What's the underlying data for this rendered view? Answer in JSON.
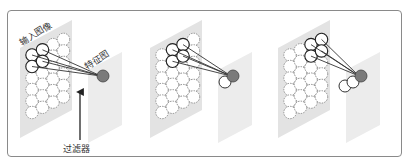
{
  "diagram": {
    "title": "",
    "labels": {
      "input_image": "输入图像",
      "feature_map": "特征图",
      "filter": "过滤器"
    },
    "panels": [
      {
        "step": 1,
        "output_circles_white": 0,
        "filter_position": "top-left"
      },
      {
        "step": 2,
        "output_circles_white": 1,
        "filter_position": "shifted-one-right"
      },
      {
        "step": 3,
        "output_circles_white": 2,
        "filter_position": "shifted-two-right"
      }
    ],
    "grid": {
      "columns": 4,
      "rows": 6
    },
    "colors": {
      "frame": "#8a8a8a",
      "input_plane": "#e3e3e3",
      "feature_plane": "#ececec",
      "filled_output": "#7a7a7a",
      "line": "#333333"
    }
  }
}
